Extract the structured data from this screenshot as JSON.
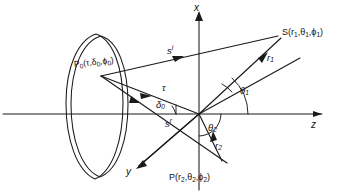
{
  "figure": {
    "kind": "line-diagram",
    "background_color": "#ffffff",
    "ink_color": "#1a1a1a",
    "width": 344,
    "height": 195
  },
  "axes": {
    "x": {
      "label": "x",
      "direction": "up",
      "arrow": true
    },
    "y": {
      "label": "y",
      "direction": "down-left",
      "arrow": true
    },
    "z": {
      "label": "z",
      "direction": "right",
      "arrow": true
    }
  },
  "points": {
    "source": {
      "name": "S",
      "label": "S(r1, θ1, ϕ1)",
      "label_parts": {
        "base": "S(r",
        "s1": "1",
        "mid": ",θ",
        "s2": "1",
        "mid2": ",ϕ",
        "s3": "1",
        "end": ")"
      }
    },
    "observation": {
      "name": "P",
      "label": "P(r2, θ2, ϕ2)",
      "label_parts": {
        "base": "P(r",
        "s1": "2",
        "mid": ",θ",
        "s2": "2",
        "mid2": ",ϕ",
        "s3": "2",
        "end": ")"
      }
    },
    "surface": {
      "name": "P0",
      "label": "P0(τ, δ0, ϕ0)",
      "label_parts": {
        "base": "P",
        "s0": "0",
        "open": "(τ,δ",
        "s1": "0",
        "mid": ",ϕ",
        "s2": "0",
        "end": ")"
      }
    },
    "origin": {
      "name": "O",
      "label": ""
    }
  },
  "vectors": [
    {
      "id": "s-incident",
      "label": "s",
      "superscript": "i",
      "meaning": "incident-direction"
    },
    {
      "id": "s-reflected",
      "label": "s",
      "superscript": "r",
      "meaning": "reflected-direction"
    },
    {
      "id": "tau",
      "label": "τ",
      "superscript": "",
      "meaning": "surface-radial-coordinate"
    },
    {
      "id": "r1",
      "label": "r",
      "subscript": "1",
      "meaning": "source-radius"
    },
    {
      "id": "r2",
      "label": "r",
      "subscript": "2",
      "meaning": "observation-radius"
    }
  ],
  "angles": [
    {
      "id": "theta1",
      "label": "θ",
      "subscript": "1",
      "meaning": "polar-angle-of-source"
    },
    {
      "id": "theta2",
      "label": "θ",
      "subscript": "2",
      "meaning": "polar-angle-of-observation"
    },
    {
      "id": "delta0",
      "label": "δ",
      "subscript": "0",
      "meaning": "surface-elevation-angle"
    }
  ],
  "shell": {
    "name": "reflector-surface",
    "shape": "double-ellipse-curved-shell"
  }
}
